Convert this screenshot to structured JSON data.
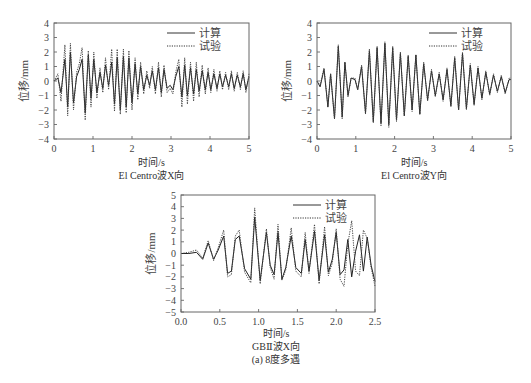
{
  "chart_data": [
    {
      "type": "line",
      "title": "El Centro波X向",
      "xlabel": "时间/s",
      "ylabel": "位移/mm",
      "xlim": [
        0,
        5
      ],
      "ylim": [
        -4,
        4
      ],
      "xticks": [
        "0",
        "1",
        "2",
        "3",
        "4",
        "5"
      ],
      "yticks": [
        "-4",
        "-3",
        "-2",
        "-1",
        "0",
        "1",
        "2",
        "3",
        "4"
      ],
      "grid": false,
      "legend_position": "upper right",
      "series": [
        {
          "name": "计算",
          "style": "solid",
          "x": [
            0,
            0.1,
            0.18,
            0.28,
            0.35,
            0.42,
            0.5,
            0.58,
            0.65,
            0.72,
            0.8,
            0.88,
            0.95,
            1.02,
            1.1,
            1.18,
            1.25,
            1.32,
            1.4,
            1.48,
            1.55,
            1.62,
            1.7,
            1.78,
            1.85,
            1.92,
            2.0,
            2.08,
            2.15,
            2.22,
            2.3,
            2.38,
            2.45,
            2.52,
            2.6,
            2.68,
            2.75,
            2.82,
            2.9,
            2.98,
            3.05,
            3.12,
            3.2,
            3.28,
            3.35,
            3.42,
            3.5,
            3.58,
            3.65,
            3.72,
            3.8,
            3.88,
            3.95,
            4.02,
            4.1,
            4.18,
            4.25,
            4.32,
            4.4,
            4.48,
            4.55,
            4.62,
            4.7,
            4.78,
            4.85,
            4.92,
            5.0
          ],
          "y": [
            0,
            0.2,
            -0.8,
            1.5,
            -1.8,
            2.0,
            -1.5,
            0.3,
            0.8,
            1.5,
            -2.2,
            1.8,
            -1.2,
            1.5,
            -0.8,
            0.6,
            -0.5,
            1.1,
            -0.3,
            1.3,
            -1.6,
            1.6,
            -2.0,
            1.7,
            -1.8,
            1.6,
            -1.5,
            1.2,
            -0.9,
            1.0,
            -0.6,
            0.4,
            -0.3,
            0.7,
            -0.6,
            0.9,
            -0.8,
            0.8,
            -0.5,
            -0.3,
            -0.6,
            0.3,
            1.0,
            -1.1,
            1.1,
            -1.0,
            0.9,
            -0.9,
            0.8,
            -0.7,
            0.7,
            -0.6,
            0.6,
            -0.6,
            0.5,
            -0.5,
            0.5,
            -0.4,
            0.4,
            -0.4,
            0.5,
            -0.5,
            0.4,
            -0.4,
            0.5,
            -0.6,
            0.3
          ]
        },
        {
          "name": "试验",
          "style": "dotted",
          "x": [
            0,
            0.1,
            0.18,
            0.28,
            0.35,
            0.42,
            0.5,
            0.58,
            0.65,
            0.72,
            0.8,
            0.88,
            0.95,
            1.02,
            1.1,
            1.18,
            1.25,
            1.32,
            1.4,
            1.48,
            1.55,
            1.62,
            1.7,
            1.78,
            1.85,
            1.92,
            2.0,
            2.08,
            2.15,
            2.22,
            2.3,
            2.38,
            2.45,
            2.52,
            2.6,
            2.68,
            2.75,
            2.82,
            2.9,
            2.98,
            3.05,
            3.12,
            3.2,
            3.28,
            3.35,
            3.42,
            3.5,
            3.58,
            3.65,
            3.72,
            3.8,
            3.88,
            3.95,
            4.02,
            4.1,
            4.18,
            4.25,
            4.32,
            4.4,
            4.48,
            4.55,
            4.62,
            4.7,
            4.78,
            4.85,
            4.92,
            5.0
          ],
          "y": [
            0,
            0.5,
            -1.4,
            2.5,
            -2.4,
            2.6,
            -2.0,
            0.6,
            1.2,
            2.3,
            -2.7,
            2.1,
            -1.8,
            2.0,
            -1.2,
            0.9,
            -0.8,
            1.6,
            -0.6,
            2.2,
            -2.1,
            2.2,
            -2.3,
            2.2,
            -2.2,
            2.1,
            -2.0,
            1.6,
            -1.3,
            1.3,
            -0.9,
            0.7,
            -0.5,
            1.0,
            -0.9,
            1.3,
            -1.1,
            1.1,
            -0.8,
            -0.5,
            -0.9,
            0.6,
            1.5,
            -1.8,
            1.6,
            -1.6,
            1.3,
            -1.4,
            1.3,
            -1.1,
            1.1,
            -0.9,
            0.9,
            -0.8,
            0.8,
            -0.7,
            0.7,
            -0.6,
            0.6,
            -0.6,
            0.7,
            -0.7,
            0.6,
            -0.6,
            0.7,
            -0.8,
            0.5
          ]
        }
      ]
    },
    {
      "type": "line",
      "title": "El Centro波Y向",
      "xlabel": "时间/s",
      "ylabel": "位移/mm",
      "xlim": [
        0,
        5
      ],
      "ylim": [
        -4,
        4
      ],
      "xticks": [
        "0",
        "1",
        "2",
        "3",
        "4",
        "5"
      ],
      "yticks": [
        "-4",
        "-3",
        "-2",
        "-1",
        "0",
        "1",
        "2",
        "3",
        "4"
      ],
      "grid": false,
      "legend_position": "upper right",
      "series": [
        {
          "name": "计算",
          "style": "solid",
          "x": [
            0,
            0.08,
            0.18,
            0.28,
            0.35,
            0.45,
            0.55,
            0.65,
            0.72,
            0.8,
            0.88,
            0.98,
            1.05,
            1.15,
            1.25,
            1.35,
            1.45,
            1.55,
            1.65,
            1.75,
            1.85,
            1.95,
            2.05,
            2.15,
            2.25,
            2.35,
            2.45,
            2.55,
            2.65,
            2.75,
            2.85,
            2.95,
            3.05,
            3.15,
            3.25,
            3.35,
            3.45,
            3.55,
            3.65,
            3.75,
            3.85,
            3.95,
            4.05,
            4.15,
            4.25,
            4.35,
            4.45,
            4.55,
            4.65,
            4.75,
            4.85,
            4.95,
            5.0
          ],
          "y": [
            0,
            -0.4,
            0.8,
            -1.8,
            0.5,
            -2.6,
            2.4,
            -2.5,
            1.3,
            -1.0,
            0.2,
            0.1,
            -0.6,
            1.0,
            -2.2,
            2.1,
            -2.8,
            2.3,
            -2.9,
            2.6,
            -3.0,
            2.3,
            -2.7,
            1.9,
            -2.4,
            1.7,
            -2.0,
            1.8,
            -2.3,
            1.2,
            -1.3,
            0.7,
            -1.0,
            0.5,
            -1.3,
            0.8,
            -1.7,
            1.6,
            -2.0,
            1.9,
            -1.9,
            1.1,
            -1.6,
            0.9,
            -1.2,
            0.6,
            -0.9,
            0.4,
            -0.7,
            0.3,
            -0.8,
            0.1,
            0.1
          ]
        },
        {
          "name": "试验",
          "style": "dotted",
          "x": [
            0,
            0.08,
            0.18,
            0.28,
            0.35,
            0.45,
            0.55,
            0.65,
            0.72,
            0.8,
            0.88,
            0.98,
            1.05,
            1.15,
            1.25,
            1.35,
            1.45,
            1.55,
            1.65,
            1.75,
            1.85,
            1.95,
            2.05,
            2.15,
            2.25,
            2.35,
            2.45,
            2.55,
            2.65,
            2.75,
            2.85,
            2.95,
            3.05,
            3.15,
            3.25,
            3.35,
            3.45,
            3.55,
            3.65,
            3.75,
            3.85,
            3.95,
            4.05,
            4.15,
            4.25,
            4.35,
            4.45,
            4.55,
            4.65,
            4.75,
            4.85,
            4.95,
            5.0
          ],
          "y": [
            0,
            -0.3,
            0.9,
            -1.7,
            0.5,
            -2.6,
            2.5,
            -2.6,
            1.3,
            -1.1,
            0.2,
            0.2,
            -0.6,
            1.1,
            -2.3,
            2.2,
            -2.9,
            2.4,
            -3.1,
            2.7,
            -3.2,
            2.4,
            -2.8,
            2.0,
            -2.4,
            1.8,
            -2.1,
            1.8,
            -2.3,
            1.3,
            -1.4,
            0.8,
            -1.1,
            0.6,
            -1.4,
            0.9,
            -1.8,
            1.7,
            -2.0,
            2.0,
            -2.0,
            1.2,
            -1.7,
            1.0,
            -1.3,
            0.7,
            -1.0,
            0.5,
            -0.8,
            0.4,
            -0.9,
            0.2,
            0.2
          ]
        }
      ]
    },
    {
      "type": "line",
      "title": "GBⅡ波X向",
      "xlabel": "时间/s",
      "ylabel": "位移/mm",
      "xlim": [
        0,
        2.5
      ],
      "ylim": [
        -5,
        5
      ],
      "xticks": [
        "0.0",
        "0.5",
        "1.0",
        "1.5",
        "2.0",
        "2.5"
      ],
      "yticks": [
        "-5",
        "-4",
        "-3",
        "-2",
        "-1",
        "0",
        "1",
        "2",
        "3",
        "4",
        "5"
      ],
      "grid": false,
      "legend_position": "upper right",
      "series": [
        {
          "name": "计算",
          "style": "solid",
          "x": [
            0,
            0.1,
            0.2,
            0.28,
            0.35,
            0.42,
            0.48,
            0.55,
            0.6,
            0.65,
            0.7,
            0.75,
            0.82,
            0.9,
            0.95,
            1.02,
            1.1,
            1.15,
            1.2,
            1.25,
            1.3,
            1.35,
            1.42,
            1.48,
            1.55,
            1.6,
            1.65,
            1.72,
            1.78,
            1.85,
            1.9,
            1.95,
            2.0,
            2.05,
            2.1,
            2.15,
            2.2,
            2.25,
            2.3,
            2.35,
            2.4,
            2.45,
            2.5
          ],
          "y": [
            0,
            0,
            0.1,
            -0.5,
            0.9,
            -0.5,
            0.3,
            1.5,
            -1.7,
            -1.5,
            1.2,
            1.5,
            -1.3,
            -2.2,
            3.1,
            -2.3,
            1.8,
            -1.0,
            -1.8,
            1.8,
            -2.2,
            -1.2,
            1.5,
            -1.2,
            -1.7,
            1.2,
            -1.5,
            1.9,
            -2.3,
            1.6,
            -1.6,
            -0.5,
            1.8,
            -1.8,
            -1.4,
            1.2,
            -2.0,
            0.2,
            1.6,
            -1.5,
            1.4,
            -1.0,
            -2.4
          ]
        },
        {
          "name": "试验",
          "style": "dotted",
          "x": [
            0,
            0.1,
            0.2,
            0.28,
            0.35,
            0.42,
            0.48,
            0.55,
            0.6,
            0.65,
            0.7,
            0.75,
            0.82,
            0.9,
            0.95,
            1.02,
            1.1,
            1.15,
            1.2,
            1.25,
            1.3,
            1.35,
            1.42,
            1.48,
            1.55,
            1.6,
            1.65,
            1.72,
            1.78,
            1.85,
            1.9,
            1.95,
            2.0,
            2.05,
            2.1,
            2.15,
            2.2,
            2.25,
            2.3,
            2.35,
            2.4,
            2.45,
            2.5
          ],
          "y": [
            0,
            0.1,
            0.3,
            -0.4,
            1.1,
            -0.6,
            0.5,
            2.0,
            -2.0,
            -1.8,
            1.5,
            2.0,
            -1.6,
            -2.5,
            3.9,
            -2.6,
            2.1,
            -1.2,
            -2.2,
            2.5,
            -2.3,
            -1.4,
            2.2,
            -1.5,
            -2.0,
            1.8,
            -1.7,
            2.5,
            -2.6,
            2.3,
            -1.9,
            -0.8,
            2.1,
            -2.2,
            -2.8,
            0.8,
            2.8,
            -1.5,
            -1.9,
            2.0,
            1.3,
            -1.2,
            -2.8
          ]
        }
      ]
    }
  ],
  "figure": {
    "caption": "(a) 8度多遇"
  }
}
